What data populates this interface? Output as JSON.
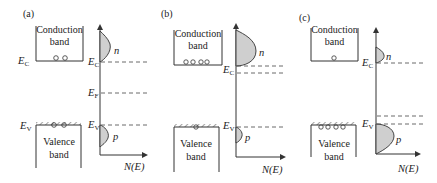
{
  "panels": [
    {
      "id": "a",
      "label": "(a)",
      "conduction_band": [
        "Conduction",
        "band"
      ],
      "valence_band": [
        "Valence",
        "band"
      ],
      "levels": {
        "EC": "E",
        "EC_sub": "C",
        "EF": "E",
        "EF_sub": "F",
        "EV": "E",
        "EV_sub": "V"
      },
      "electrons": 2,
      "holes": 2,
      "n_label": "n",
      "p_label": "p",
      "axis_label": "N(E)",
      "type": "intrinsic"
    },
    {
      "id": "b",
      "label": "(b)",
      "conduction_band": [
        "Conduction",
        "band"
      ],
      "valence_band": [
        "Valence",
        "band"
      ],
      "levels": {
        "EC": "E",
        "EC_sub": "C",
        "EV": "E",
        "EV_sub": "V"
      },
      "electrons": 4,
      "holes": 1,
      "n_label": "n",
      "p_label": "p",
      "axis_label": "N(E)",
      "type": "n-type"
    },
    {
      "id": "c",
      "label": "(c)",
      "conduction_band": [
        "Conduction",
        "band"
      ],
      "valence_band": [
        "Valence",
        "band"
      ],
      "levels": {
        "EC": "E",
        "EC_sub": "C",
        "EV": "E",
        "EV_sub": "V"
      },
      "electrons": 1,
      "holes": 4,
      "n_label": "n",
      "p_label": "p",
      "axis_label": "N(E)",
      "type": "p-type"
    }
  ]
}
